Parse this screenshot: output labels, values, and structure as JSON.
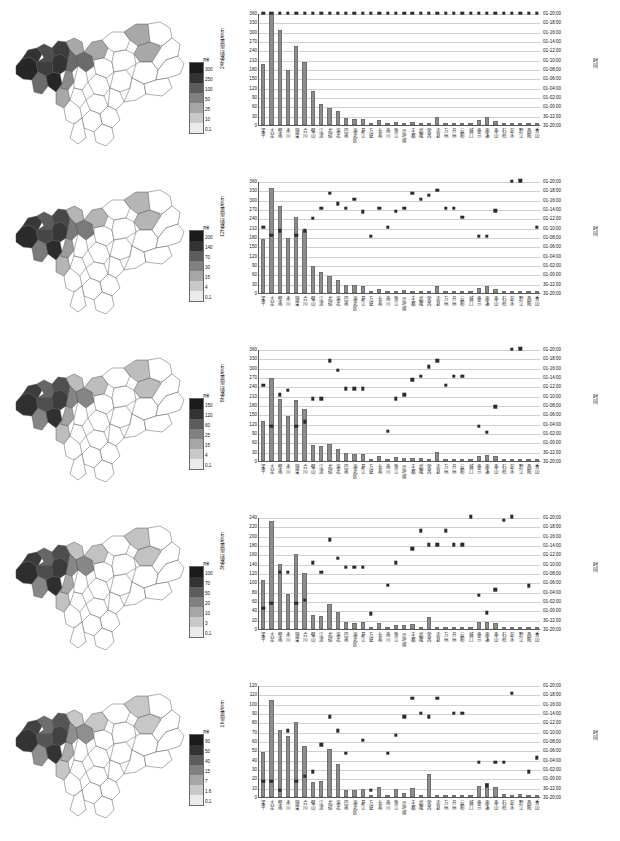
{
  "figure": {
    "stations": [
      "梁平",
      "大足",
      "壁南",
      "永川",
      "铜梁",
      "合川",
      "璧山",
      "江津",
      "北碚",
      "渝北",
      "巴南",
      "渝北区",
      "綦江",
      "万盛",
      "长寿",
      "南川",
      "垫江",
      "沙坪坝",
      "丰都",
      "武隆",
      "荣昌",
      "忠县",
      "万州",
      "开州",
      "云阳",
      "城口",
      "奉节",
      "巫溪",
      "巫山",
      "石柱",
      "彭水",
      "黔江",
      "酉阳",
      "秀山"
    ],
    "right_axis_title": "时间",
    "time_ticks": [
      "01-20:00",
      "01-18:00",
      "01-16:00",
      "01-14:00",
      "01-12:00",
      "01-10:00",
      "01-08:00",
      "01-06:00",
      "01-04:00",
      "01-02:00",
      "01-00:00",
      "30-22:00",
      "30-20:00"
    ]
  },
  "chart_data": [
    {
      "type": "bar",
      "panel": 1,
      "ylabel": "24h累积雨量/mm",
      "ylim": [
        0,
        360
      ],
      "ystep": 30,
      "yticks": [
        0,
        30,
        60,
        90,
        120,
        150,
        180,
        210,
        240,
        270,
        300,
        330,
        360
      ],
      "rlabel": "时间",
      "rticks": [
        "30-20:00",
        "30-22:00",
        "01-00:00",
        "01-02:00",
        "01-04:00",
        "01-06:00",
        "01-08:00",
        "01-10:00",
        "01-12:00",
        "01-14:00",
        "01-16:00",
        "01-18:00",
        "01-20:00"
      ],
      "categories": [
        "梁平",
        "大足",
        "壁南",
        "永川",
        "铜梁",
        "合川",
        "璧山",
        "江津",
        "北碚",
        "渝北",
        "巴南",
        "渝北区",
        "綦江",
        "万盛",
        "长寿",
        "南川",
        "垫江",
        "沙坪坝",
        "丰都",
        "武隆",
        "荣昌",
        "忠县",
        "万州",
        "开州",
        "云阳",
        "城口",
        "奉节",
        "巫溪",
        "巫山",
        "石柱",
        "彭水",
        "黔江",
        "酉阳",
        "秀山"
      ],
      "values": [
        197,
        362,
        305,
        178,
        255,
        203,
        110,
        68,
        55,
        44,
        22,
        20,
        20,
        2,
        17,
        3,
        9,
        8,
        9,
        6,
        3,
        25,
        2,
        2,
        2,
        2,
        17,
        25,
        12,
        3,
        3,
        4,
        3,
        3
      ],
      "series_points": [
        360,
        360,
        360,
        360,
        360,
        360,
        360,
        360,
        360,
        360,
        360,
        360,
        360,
        360,
        360,
        360,
        360,
        360,
        360,
        360,
        360,
        360,
        360,
        360,
        360,
        360,
        360,
        360,
        360,
        360,
        360,
        360,
        360,
        360
      ],
      "legend": [],
      "grid": true,
      "title": ""
    },
    {
      "type": "bar",
      "panel": 2,
      "ylabel": "12h累积雨量/mm",
      "ylim": [
        0,
        360
      ],
      "ystep": 30,
      "yticks": [
        0,
        30,
        60,
        90,
        120,
        150,
        180,
        210,
        240,
        270,
        300,
        330,
        360
      ],
      "rlabel": "时间",
      "rticks": [
        "30-20:00",
        "30-22:00",
        "01-00:00",
        "01-02:00",
        "01-04:00",
        "01-06:00",
        "01-08:00",
        "01-10:00",
        "01-12:00",
        "01-14:00",
        "01-16:00",
        "01-18:00",
        "01-20:00"
      ],
      "categories": [
        "梁平",
        "大足",
        "壁南",
        "永川",
        "铜梁",
        "合川",
        "璧山",
        "江津",
        "北碚",
        "渝北",
        "巴南",
        "渝北区",
        "綦江",
        "万盛",
        "长寿",
        "南川",
        "垫江",
        "沙坪坝",
        "丰都",
        "武隆",
        "荣昌",
        "忠县",
        "万州",
        "开州",
        "云阳",
        "城口",
        "奉节",
        "巫溪",
        "巫山",
        "石柱",
        "彭水",
        "黔江",
        "酉阳",
        "秀山"
      ],
      "values": [
        175,
        338,
        281,
        176,
        245,
        201,
        87,
        67,
        56,
        41,
        26,
        25,
        24,
        3,
        13,
        4,
        8,
        9,
        7,
        8,
        3,
        24,
        2,
        3,
        2,
        2,
        17,
        21,
        14,
        4,
        3,
        5,
        3,
        3
      ],
      "series_points": [
        212,
        185,
        200,
        null,
        185,
        200,
        241,
        272,
        321,
        287,
        272,
        302,
        262,
        183,
        272,
        212,
        263,
        272,
        321,
        302,
        315,
        331,
        272,
        272,
        244,
        null,
        183,
        183,
        265,
        null,
        360,
        361,
        null,
        212
      ],
      "grid": true,
      "title": ""
    },
    {
      "type": "bar",
      "panel": 3,
      "ylabel": "6h累积雨量/mm",
      "ylim": [
        0,
        360
      ],
      "ystep": 30,
      "yticks": [
        0,
        30,
        60,
        90,
        120,
        150,
        180,
        210,
        240,
        270,
        300,
        330,
        360
      ],
      "rlabel": "时间",
      "rticks": [
        "30-20:00",
        "30-22:00",
        "01-00:00",
        "01-02:00",
        "01-04:00",
        "01-06:00",
        "01-08:00",
        "01-10:00",
        "01-12:00",
        "01-14:00",
        "01-16:00",
        "01-18:00",
        "01-20:00"
      ],
      "categories": [
        "梁平",
        "大足",
        "壁南",
        "永川",
        "铜梁",
        "合川",
        "璧山",
        "江津",
        "北碚",
        "渝北",
        "巴南",
        "渝北区",
        "綦江",
        "万盛",
        "长寿",
        "南川",
        "垫江",
        "沙坪坝",
        "丰都",
        "武隆",
        "荣昌",
        "忠县",
        "万州",
        "开州",
        "云阳",
        "城口",
        "奉节",
        "巫溪",
        "巫山",
        "石柱",
        "彭水",
        "黔江",
        "酉阳",
        "秀山"
      ],
      "values": [
        128,
        267,
        199,
        145,
        197,
        166,
        52,
        47,
        55,
        40,
        26,
        21,
        24,
        2,
        17,
        2,
        14,
        11,
        10,
        9,
        3,
        29,
        2,
        4,
        3,
        3,
        17,
        19,
        16,
        3,
        3,
        5,
        2,
        3
      ],
      "series_points": [
        244,
        112,
        213,
        228,
        112,
        127,
        200,
        200,
        322,
        291,
        232,
        232,
        232,
        null,
        null,
        96,
        200,
        213,
        261,
        272,
        303,
        322,
        244,
        272,
        272,
        null,
        112,
        93,
        175,
        null,
        360,
        361,
        null,
        null
      ],
      "grid": true,
      "title": ""
    },
    {
      "type": "bar",
      "panel": 4,
      "ylabel": "3h累积雨量/mm",
      "ylim": [
        0,
        240
      ],
      "ystep": 20,
      "yticks": [
        0,
        20,
        40,
        60,
        80,
        100,
        120,
        140,
        160,
        180,
        200,
        220,
        240
      ],
      "rlabel": "时间",
      "rticks": [
        "30-20:00",
        "30-22:00",
        "01-00:00",
        "01-02:00",
        "01-04:00",
        "01-06:00",
        "01-08:00",
        "01-10:00",
        "01-12:00",
        "01-14:00",
        "01-16:00",
        "01-18:00",
        "01-20:00"
      ],
      "categories": [
        "梁平",
        "大足",
        "壁南",
        "永川",
        "铜梁",
        "合川",
        "璧山",
        "江津",
        "北碚",
        "渝北",
        "巴南",
        "渝北区",
        "綦江",
        "万盛",
        "长寿",
        "南川",
        "垫江",
        "沙坪坝",
        "丰都",
        "武隆",
        "荣昌",
        "忠县",
        "万州",
        "开州",
        "云阳",
        "城口",
        "奉节",
        "巫溪",
        "巫山",
        "石柱",
        "彭水",
        "黔江",
        "酉阳",
        "秀山"
      ],
      "values": [
        105,
        231,
        139,
        75,
        160,
        121,
        30,
        28,
        54,
        36,
        15,
        13,
        16,
        2,
        13,
        3,
        8,
        9,
        10,
        4,
        25,
        2,
        2,
        3,
        2,
        2,
        14,
        15,
        13,
        5,
        4,
        5,
        3,
        2
      ],
      "series_points": [
        45,
        55,
        122,
        122,
        55,
        62,
        142,
        122,
        191,
        152,
        133,
        133,
        132,
        33,
        null,
        94,
        142,
        null,
        172,
        211,
        181,
        181,
        211,
        181,
        181,
        241,
        72,
        35,
        84,
        233,
        241,
        null,
        93,
        null
      ],
      "grid": true,
      "title": ""
    },
    {
      "type": "bar",
      "panel": 5,
      "ylabel": "1h雨量/mm",
      "ylim": [
        0,
        120
      ],
      "ystep": 10,
      "yticks": [
        0,
        10,
        20,
        30,
        40,
        50,
        60,
        70,
        80,
        90,
        100,
        110,
        120
      ],
      "rlabel": "时间",
      "rticks": [
        "30-20:00",
        "30-22:00",
        "01-00:00",
        "01-02:00",
        "01-04:00",
        "01-06:00",
        "01-08:00",
        "01-10:00",
        "01-12:00",
        "01-14:00",
        "01-16:00",
        "01-18:00",
        "01-20:00"
      ],
      "categories": [
        "梁平",
        "大足",
        "壁南",
        "永川",
        "铜梁",
        "合川",
        "璧山",
        "江津",
        "北碚",
        "渝北",
        "巴南",
        "渝北区",
        "綦江",
        "万盛",
        "长寿",
        "南川",
        "垫江",
        "沙坪坝",
        "丰都",
        "武隆",
        "荣昌",
        "忠县",
        "万州",
        "开州",
        "云阳",
        "城口",
        "奉节",
        "巫溪",
        "巫山",
        "石柱",
        "彭水",
        "黔江",
        "酉阳",
        "秀山"
      ],
      "values": [
        48,
        104,
        72,
        65,
        80,
        55,
        16,
        17,
        51,
        35,
        8,
        8,
        9,
        2,
        11,
        2,
        9,
        4,
        10,
        2,
        25,
        1,
        1,
        2,
        1,
        1,
        12,
        15,
        11,
        3,
        2,
        3,
        2,
        2
      ],
      "series_points": [
        17,
        17,
        7,
        71,
        17,
        22,
        27,
        56,
        86,
        71,
        47,
        null,
        61,
        7,
        null,
        47,
        66,
        86,
        106,
        90,
        86,
        106,
        null,
        90,
        90,
        null,
        37,
        12,
        37,
        37,
        111,
        null,
        27,
        42
      ],
      "grid": true,
      "title": ""
    }
  ],
  "map_legends": [
    {
      "panel": 1,
      "title": "雨量",
      "ticks": [
        "300",
        "250",
        "100",
        "50",
        "25",
        "10",
        "0.1"
      ],
      "colors": [
        "#1a1a1a",
        "#333333",
        "#5c5c5c",
        "#808080",
        "#a6a6a6",
        "#c9c9c9",
        "#ebebeb"
      ]
    },
    {
      "panel": 2,
      "title": "雨量",
      "ticks": [
        "200",
        "140",
        "70",
        "30",
        "15",
        "4",
        "0.1"
      ],
      "colors": [
        "#1a1a1a",
        "#333333",
        "#5c5c5c",
        "#808080",
        "#a6a6a6",
        "#c9c9c9",
        "#ebebeb"
      ]
    },
    {
      "panel": 3,
      "title": "雨量",
      "ticks": [
        "150",
        "120",
        "60",
        "25",
        "15",
        "4",
        "0.1"
      ],
      "colors": [
        "#1a1a1a",
        "#333333",
        "#5c5c5c",
        "#808080",
        "#a6a6a6",
        "#c9c9c9",
        "#ebebeb"
      ]
    },
    {
      "panel": 4,
      "title": "雨量",
      "ticks": [
        "100",
        "70",
        "50",
        "20",
        "10",
        "3",
        "0.1"
      ],
      "colors": [
        "#1a1a1a",
        "#333333",
        "#5c5c5c",
        "#808080",
        "#a6a6a6",
        "#c9c9c9",
        "#ebebeb"
      ]
    },
    {
      "panel": 5,
      "title": "雨量",
      "ticks": [
        "90",
        "50",
        "40",
        "15",
        "7",
        "1.6",
        "0.1"
      ],
      "colors": [
        "#1a1a1a",
        "#333333",
        "#5c5c5c",
        "#808080",
        "#a6a6a6",
        "#c9c9c9",
        "#ebebeb"
      ]
    }
  ],
  "map_shading": [
    {
      "panel": 1,
      "dark": [
        "#262626",
        "#333333",
        "#3d3d3d",
        "#4d4d4d",
        "#6b6b6b",
        "#8a8a8a",
        "#a8a8a8"
      ]
    },
    {
      "panel": 2,
      "dark": [
        "#2b2b2b",
        "#383838",
        "#474747",
        "#5c5c5c",
        "#7a7a7a",
        "#9c9c9c",
        "#b5b5b5"
      ]
    },
    {
      "panel": 3,
      "dark": [
        "#303030",
        "#3d3d3d",
        "#4f4f4f",
        "#666666",
        "#858585",
        "#a3a3a3",
        "#bdbdbd"
      ]
    },
    {
      "panel": 4,
      "dark": [
        "#2e2e2e",
        "#3b3b3b",
        "#4d4d4d",
        "#666666",
        "#878787",
        "#a8a8a8",
        "#c2c2c2"
      ]
    },
    {
      "panel": 5,
      "dark": [
        "#333333",
        "#424242",
        "#555555",
        "#6e6e6e",
        "#8f8f8f",
        "#adadad",
        "#c7c7c7"
      ]
    }
  ]
}
